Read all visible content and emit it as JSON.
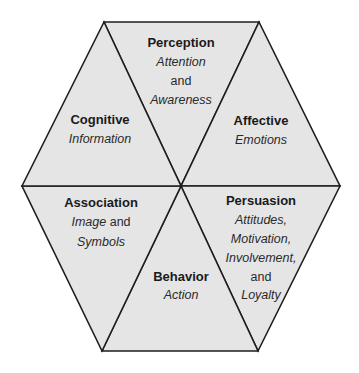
{
  "diagram": {
    "type": "hexagon-of-six-triangles",
    "colors": {
      "fill": "#e5e5e5",
      "stroke": "#1e1e1e",
      "text": "#1a1a1a",
      "background": "#ffffff"
    },
    "segments": [
      {
        "id": "perception",
        "title": "Perception",
        "lines": [
          {
            "text": "Attention",
            "style": "italic"
          },
          {
            "text": "and",
            "style": "plain"
          },
          {
            "text": "Awareness",
            "style": "italic"
          }
        ]
      },
      {
        "id": "affective",
        "title": "Affective",
        "lines": [
          {
            "text": "Emotions",
            "style": "italic"
          }
        ]
      },
      {
        "id": "persuasion",
        "title": "Persuasion",
        "lines": [
          {
            "text": "Attitudes,",
            "style": "italic"
          },
          {
            "text": "Motivation,",
            "style": "italic"
          },
          {
            "text": "Involvement,",
            "style": "italic"
          },
          {
            "text": "and",
            "style": "plain"
          },
          {
            "text": "Loyalty",
            "style": "italic"
          }
        ]
      },
      {
        "id": "behavior",
        "title": "Behavior",
        "lines": [
          {
            "text": "Action",
            "style": "italic"
          }
        ]
      },
      {
        "id": "association",
        "title": "Association",
        "lines": [
          {
            "text": "Image",
            "style": "italic",
            "suffix": " and"
          },
          {
            "text": "Symbols",
            "style": "italic"
          }
        ]
      },
      {
        "id": "cognitive",
        "title": "Cognitive",
        "lines": [
          {
            "text": "Information",
            "style": "italic"
          }
        ]
      }
    ]
  },
  "labels": {
    "perception": {
      "title": "Perception",
      "l1": "Attention",
      "l2": "and",
      "l3": "Awareness"
    },
    "affective": {
      "title": "Affective",
      "l1": "Emotions"
    },
    "persuasion": {
      "title": "Persuasion",
      "l1": "Attitudes,",
      "l2": "Motivation,",
      "l3": "Involvement,",
      "l4": "and",
      "l5": "Loyalty"
    },
    "behavior": {
      "title": "Behavior",
      "l1": "Action"
    },
    "association": {
      "title": "Association",
      "l1a": "Image",
      "l1b": " and",
      "l2": "Symbols"
    },
    "cognitive": {
      "title": "Cognitive",
      "l1": "Information"
    }
  }
}
